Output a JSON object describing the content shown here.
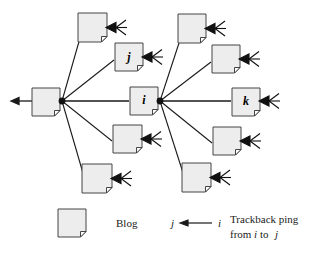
{
  "figure": {
    "type": "diagram",
    "title": ""
  },
  "style": {
    "blog_fill": "#ededed",
    "blog_stroke": "#444444",
    "edge_color": "#1a1a1a",
    "background": "#ffffff",
    "fold_fill": "#ffffff"
  },
  "nodes": [
    {
      "id": "root",
      "label": "",
      "x": 32,
      "y": 88,
      "w": 28,
      "h": 28,
      "hub": true,
      "incoming_marks": false,
      "out_arrow_left": true
    },
    {
      "id": "tl",
      "label": "",
      "x": 78,
      "y": 13,
      "w": 29,
      "h": 29,
      "hub": false,
      "incoming_marks": true,
      "out_arrow_left": false
    },
    {
      "id": "j",
      "label": "j",
      "x": 115,
      "y": 43,
      "w": 28,
      "h": 28,
      "hub": false,
      "incoming_marks": true,
      "out_arrow_left": false
    },
    {
      "id": "i",
      "label": "i",
      "x": 130,
      "y": 87,
      "w": 28,
      "h": 28,
      "hub": true,
      "incoming_marks": false,
      "out_arrow_left": false
    },
    {
      "id": "ml",
      "label": "",
      "x": 113,
      "y": 125,
      "w": 29,
      "h": 28,
      "hub": false,
      "incoming_marks": true,
      "out_arrow_left": false
    },
    {
      "id": "bl",
      "label": "",
      "x": 82,
      "y": 164,
      "w": 30,
      "h": 29,
      "hub": false,
      "incoming_marks": true,
      "out_arrow_left": false
    },
    {
      "id": "tr",
      "label": "",
      "x": 178,
      "y": 14,
      "w": 28,
      "h": 29,
      "hub": false,
      "incoming_marks": true,
      "out_arrow_left": false
    },
    {
      "id": "ur",
      "label": "",
      "x": 212,
      "y": 45,
      "w": 28,
      "h": 28,
      "hub": false,
      "incoming_marks": true,
      "out_arrow_left": false
    },
    {
      "id": "k",
      "label": "k",
      "x": 232,
      "y": 88,
      "w": 28,
      "h": 28,
      "hub": false,
      "incoming_marks": true,
      "out_arrow_left": false
    },
    {
      "id": "mr",
      "label": "",
      "x": 213,
      "y": 127,
      "w": 28,
      "h": 28,
      "hub": false,
      "incoming_marks": true,
      "out_arrow_left": false
    },
    {
      "id": "br",
      "label": "",
      "x": 182,
      "y": 163,
      "w": 29,
      "h": 29,
      "hub": false,
      "incoming_marks": true,
      "out_arrow_left": false
    }
  ],
  "hubs": [
    {
      "id": "hub-root",
      "x": 62,
      "y": 101
    },
    {
      "id": "hub-i",
      "x": 160,
      "y": 101
    }
  ],
  "edges": [
    {
      "id": "root-tl",
      "from": "hub-root",
      "to_x": 80,
      "to_y": 38
    },
    {
      "id": "root-j",
      "from": "hub-root",
      "to_x": 114,
      "to_y": 60
    },
    {
      "id": "root-i",
      "from": "hub-root",
      "to_x": 129,
      "to_y": 101
    },
    {
      "id": "root-ml",
      "from": "hub-root",
      "to_x": 112,
      "to_y": 141
    },
    {
      "id": "root-bl",
      "from": "hub-root",
      "to_x": 84,
      "to_y": 181
    },
    {
      "id": "i-tr",
      "from": "hub-i",
      "to_x": 180,
      "to_y": 40
    },
    {
      "id": "i-ur",
      "from": "hub-i",
      "to_x": 211,
      "to_y": 62
    },
    {
      "id": "i-k",
      "from": "hub-i",
      "to_x": 231,
      "to_y": 101
    },
    {
      "id": "i-mr",
      "from": "hub-i",
      "to_x": 212,
      "to_y": 143
    },
    {
      "id": "i-br",
      "from": "hub-i",
      "to_x": 184,
      "to_y": 180
    }
  ],
  "legend": {
    "blog_label": "Blog",
    "arrow_source_label": "i",
    "arrow_target_label": "j",
    "ping_line1": "Trackback ping",
    "ping_line2_before": "from",
    "ping_line2_i": "i",
    "ping_line2_to": "to",
    "ping_line2_j": "j"
  }
}
